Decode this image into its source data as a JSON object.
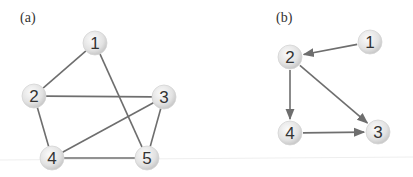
{
  "diagram": {
    "panels": [
      {
        "id": "a",
        "label": "(a)",
        "label_pos": [
          20,
          22
        ],
        "directed": false,
        "nodes": [
          {
            "id": "1",
            "label": "1",
            "x": 95,
            "y": 43
          },
          {
            "id": "2",
            "label": "2",
            "x": 34,
            "y": 96
          },
          {
            "id": "3",
            "label": "3",
            "x": 164,
            "y": 97
          },
          {
            "id": "4",
            "label": "4",
            "x": 52,
            "y": 158
          },
          {
            "id": "5",
            "label": "5",
            "x": 147,
            "y": 158
          }
        ],
        "edges": [
          {
            "from": "1",
            "to": "2"
          },
          {
            "from": "1",
            "to": "5"
          },
          {
            "from": "2",
            "to": "3"
          },
          {
            "from": "2",
            "to": "4"
          },
          {
            "from": "3",
            "to": "4"
          },
          {
            "from": "3",
            "to": "5"
          },
          {
            "from": "4",
            "to": "5"
          }
        ]
      },
      {
        "id": "b",
        "label": "(b)",
        "label_pos": [
          276,
          22
        ],
        "directed": true,
        "nodes": [
          {
            "id": "1",
            "label": "1",
            "x": 370,
            "y": 42
          },
          {
            "id": "2",
            "label": "2",
            "x": 290,
            "y": 57
          },
          {
            "id": "3",
            "label": "3",
            "x": 378,
            "y": 132
          },
          {
            "id": "4",
            "label": "4",
            "x": 290,
            "y": 133
          }
        ],
        "edges": [
          {
            "from": "1",
            "to": "2"
          },
          {
            "from": "2",
            "to": "4"
          },
          {
            "from": "2",
            "to": "3"
          },
          {
            "from": "4",
            "to": "3"
          }
        ]
      }
    ],
    "colors": {
      "edge": "#6e6e6e",
      "node_fill_light": "#fafafa",
      "node_fill_dark": "#cfcfcf",
      "node_text": "#333333"
    }
  }
}
